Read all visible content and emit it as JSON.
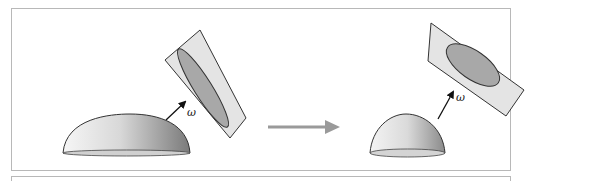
{
  "diagram": {
    "type": "before-after transformation",
    "left_panel": {
      "shape": "flat hemisphere dome",
      "vector_label": "ω",
      "plane": "tilted plane with elongated ellipse"
    },
    "transition_arrow": "right-arrow",
    "right_panel": {
      "shape": "hemisphere dome",
      "vector_label": "ω",
      "plane": "tilted plane with wider ellipse"
    },
    "colors": {
      "frame": "#b8b8b8",
      "plane_fill": "#e4e4e4",
      "ellipse_fill": "#a8a8a8",
      "arrow_gray": "#9a9a9a",
      "outline": "#333333"
    }
  }
}
